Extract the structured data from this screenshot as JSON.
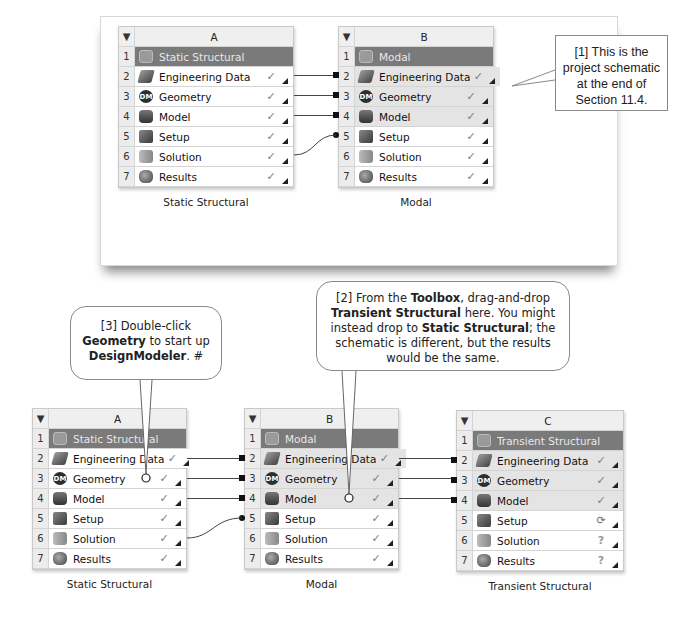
{
  "top_schematic": {
    "systems": [
      {
        "column": "A",
        "title": "Static Structural",
        "caption": "Static Structural",
        "rows": [
          {
            "num": "2",
            "label": "Engineering Data",
            "status": "✓",
            "icon": "engineering-data-icon"
          },
          {
            "num": "3",
            "label": "Geometry",
            "status": "✓",
            "icon": "geometry-icon"
          },
          {
            "num": "4",
            "label": "Model",
            "status": "✓",
            "icon": "model-icon"
          },
          {
            "num": "5",
            "label": "Setup",
            "status": "✓",
            "icon": "setup-icon"
          },
          {
            "num": "6",
            "label": "Solution",
            "status": "✓",
            "icon": "solution-icon"
          },
          {
            "num": "7",
            "label": "Results",
            "status": "✓",
            "icon": "results-icon"
          }
        ]
      },
      {
        "column": "B",
        "title": "Modal",
        "caption": "Modal",
        "rows": [
          {
            "num": "2",
            "label": "Engineering Data",
            "status": "✓",
            "icon": "engineering-data-icon"
          },
          {
            "num": "3",
            "label": "Geometry",
            "status": "✓",
            "icon": "geometry-icon"
          },
          {
            "num": "4",
            "label": "Model",
            "status": "✓",
            "icon": "model-icon"
          },
          {
            "num": "5",
            "label": "Setup",
            "status": "✓",
            "icon": "setup-icon"
          },
          {
            "num": "6",
            "label": "Solution",
            "status": "✓",
            "icon": "solution-icon"
          },
          {
            "num": "7",
            "label": "Results",
            "status": "✓",
            "icon": "results-icon"
          }
        ]
      }
    ]
  },
  "bottom_schematic": {
    "systems": [
      {
        "column": "A",
        "title": "Static Structural",
        "caption": "Static Structural",
        "rows": [
          {
            "num": "2",
            "label": "Engineering Data",
            "status": "✓"
          },
          {
            "num": "3",
            "label": "Geometry",
            "status": "✓"
          },
          {
            "num": "4",
            "label": "Model",
            "status": "✓"
          },
          {
            "num": "5",
            "label": "Setup",
            "status": "✓"
          },
          {
            "num": "6",
            "label": "Solution",
            "status": "✓"
          },
          {
            "num": "7",
            "label": "Results",
            "status": "✓"
          }
        ]
      },
      {
        "column": "B",
        "title": "Modal",
        "caption": "Modal",
        "rows": [
          {
            "num": "2",
            "label": "Engineering Data",
            "status": "✓"
          },
          {
            "num": "3",
            "label": "Geometry",
            "status": "✓"
          },
          {
            "num": "4",
            "label": "Model",
            "status": "✓"
          },
          {
            "num": "5",
            "label": "Setup",
            "status": "✓"
          },
          {
            "num": "6",
            "label": "Solution",
            "status": "✓"
          },
          {
            "num": "7",
            "label": "Results",
            "status": "✓"
          }
        ]
      },
      {
        "column": "C",
        "title": "Transient Structural",
        "caption": "Transient Structural",
        "rows": [
          {
            "num": "2",
            "label": "Engineering Data",
            "status": "✓"
          },
          {
            "num": "3",
            "label": "Geometry",
            "status": "✓"
          },
          {
            "num": "4",
            "label": "Model",
            "status": "✓"
          },
          {
            "num": "5",
            "label": "Setup",
            "status": "⟳"
          },
          {
            "num": "6",
            "label": "Solution",
            "status": "?"
          },
          {
            "num": "7",
            "label": "Results",
            "status": "?"
          }
        ]
      }
    ]
  },
  "row_one_num": "1",
  "header_menu_glyph": "▼",
  "callouts": {
    "c1": {
      "text": "[1] This is the project schematic at the end of Section 11.4."
    },
    "c2": {
      "p1": "[2] From the ",
      "b1": "Toolbox",
      "p2": ", drag-and-drop ",
      "b2": "Transient Structural",
      "p3": " here. You might instead drop to ",
      "b3": "Static Structural",
      "p4": "; the schematic is different, but the results would be the same."
    },
    "c3": {
      "p1": "[3] Double-click ",
      "b1": "Geometry",
      "p2": " to start up ",
      "b2": "DesignModeler",
      "p3": ". #"
    }
  }
}
